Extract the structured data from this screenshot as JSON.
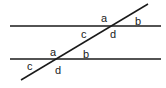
{
  "diagram": {
    "type": "parallel-lines-transversal",
    "stroke_color": "#1a1a1a",
    "lines": {
      "top_parallel": {
        "x1": 10,
        "y1": 26,
        "x2": 161,
        "y2": 26
      },
      "bottom_parallel": {
        "x1": 10,
        "y1": 59,
        "x2": 161,
        "y2": 59
      },
      "transversal": {
        "x1": 21,
        "y1": 80,
        "x2": 148,
        "y2": 4
      }
    },
    "intersections": {
      "top": {
        "labels": {
          "a": "a",
          "b": "b",
          "c": "c",
          "d": "d"
        }
      },
      "bottom": {
        "labels": {
          "a": "a",
          "b": "b",
          "c": "c",
          "d": "d"
        }
      }
    }
  }
}
